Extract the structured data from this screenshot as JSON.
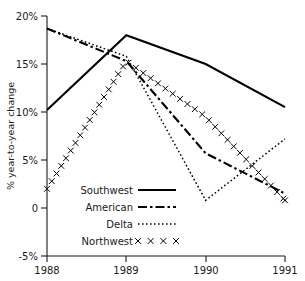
{
  "chart_data": {
    "type": "line",
    "title": "",
    "subtitle": "",
    "xlabel": "",
    "ylabel": "% year-to-year change",
    "x": [
      1988,
      1989,
      1990,
      1991
    ],
    "xtick_labels": [
      "1988",
      "1989",
      "1990",
      "1991"
    ],
    "xlim": [
      1988,
      1991
    ],
    "ylim": [
      -5,
      20
    ],
    "ytick_values": [
      20,
      15,
      10,
      5,
      0,
      -5
    ],
    "ytick_labels": [
      "20%",
      "15%",
      "10%",
      "5%",
      "0",
      "-5%"
    ],
    "grid": false,
    "legend_position": "inside-lower-left",
    "series": [
      {
        "name": "Southwest",
        "style": "solid",
        "color": "#000000",
        "values": [
          10.2,
          18.0,
          15.0,
          10.5
        ]
      },
      {
        "name": "American",
        "style": "dash-dot",
        "color": "#000000",
        "values": [
          18.7,
          15.3,
          5.7,
          1.5
        ]
      },
      {
        "name": "Delta",
        "style": "dotted",
        "color": "#000000",
        "values": [
          18.7,
          15.8,
          0.8,
          7.2
        ]
      },
      {
        "name": "Northwest",
        "style": "x-markers",
        "color": "#000000",
        "values": [
          2.0,
          15.3,
          9.5,
          0.8
        ]
      }
    ]
  },
  "axes": {
    "y_title": "% year-to-year change",
    "y_ticks": [
      {
        "label": "20%",
        "value": 20
      },
      {
        "label": "15%",
        "value": 15
      },
      {
        "label": "10%",
        "value": 10
      },
      {
        "label": "5%",
        "value": 5
      },
      {
        "label": "0",
        "value": 0
      },
      {
        "label": "-5%",
        "value": -5
      }
    ],
    "x_ticks": [
      {
        "label": "1988",
        "value": 1988
      },
      {
        "label": "1989",
        "value": 1989
      },
      {
        "label": "1990",
        "value": 1990
      },
      {
        "label": "1991",
        "value": 1991
      }
    ]
  },
  "legend": {
    "items": [
      {
        "label": "Southwest",
        "style": "solid"
      },
      {
        "label": "American",
        "style": "dash-dot"
      },
      {
        "label": "Delta",
        "style": "dotted"
      },
      {
        "label": "Northwest",
        "style": "x-markers"
      }
    ]
  }
}
